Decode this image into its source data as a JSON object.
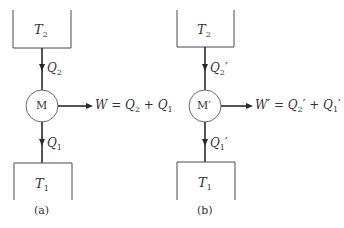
{
  "diagram": {
    "colors": {
      "stroke": "#4a4a4a",
      "text": "#333333",
      "background": "#ffffff"
    },
    "panels": [
      {
        "id": "a",
        "caption": "(a)",
        "hot_reservoir": {
          "symbol": "T",
          "subscript": "2"
        },
        "cold_reservoir": {
          "symbol": "T",
          "subscript": "1"
        },
        "machine": {
          "label": "M"
        },
        "heat_in": {
          "symbol": "Q",
          "subscript": "2",
          "prime": ""
        },
        "heat_out": {
          "symbol": "Q",
          "subscript": "1",
          "prime": ""
        },
        "work": {
          "lhs": "W",
          "equals": " = ",
          "term1": {
            "symbol": "Q",
            "subscript": "2",
            "prime": ""
          },
          "plus": " + ",
          "term2": {
            "symbol": "Q",
            "subscript": "1",
            "prime": ""
          }
        }
      },
      {
        "id": "b",
        "caption": "(b)",
        "hot_reservoir": {
          "symbol": "T",
          "subscript": "2"
        },
        "cold_reservoir": {
          "symbol": "T",
          "subscript": "1"
        },
        "machine": {
          "label": "M′"
        },
        "heat_in": {
          "symbol": "Q",
          "subscript": "2",
          "prime": "′"
        },
        "heat_out": {
          "symbol": "Q",
          "subscript": "1",
          "prime": "′"
        },
        "work": {
          "lhs": "W′",
          "equals": " = ",
          "term1": {
            "symbol": "Q",
            "subscript": "2",
            "prime": "′"
          },
          "plus": " + ",
          "term2": {
            "symbol": "Q",
            "subscript": "1",
            "prime": "′"
          }
        }
      }
    ]
  }
}
